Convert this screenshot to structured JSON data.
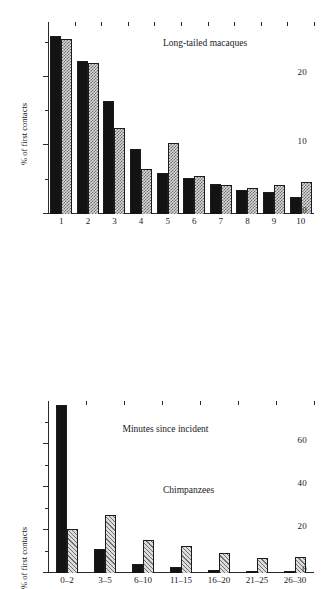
{
  "figure": {
    "background": "#ffffff",
    "series_colors": {
      "solid": "#131313",
      "patterned": "#d9d9d9"
    }
  },
  "chart_data": [
    {
      "type": "bar",
      "title": "Long-tailed macaques",
      "xlabel": "",
      "ylabel": "% of first contacts",
      "ylim": [
        0,
        28
      ],
      "yticks": [
        0,
        10,
        20
      ],
      "yticklabels": [
        "0",
        "10",
        "20"
      ],
      "yminorticks": [
        5,
        15,
        25
      ],
      "grid": false,
      "legend": "none",
      "categories": [
        "1",
        "2",
        "3",
        "4",
        "5",
        "6",
        "7",
        "8",
        "9",
        "10"
      ],
      "series": [
        {
          "name": "solid",
          "fill": "solid-black",
          "values": [
            26.0,
            22.3,
            16.5,
            9.5,
            6.0,
            5.3,
            4.4,
            3.5,
            3.2,
            2.5
          ]
        },
        {
          "name": "patterned",
          "fill": "checkerboard-grey",
          "values": [
            25.5,
            22.0,
            12.5,
            6.5,
            10.3,
            5.5,
            4.2,
            3.8,
            4.2,
            4.7
          ]
        }
      ]
    },
    {
      "type": "bar",
      "title": "Chimpanzees",
      "xlabel": "Minutes since incident",
      "ylabel": "% of first contacts",
      "ylim": [
        0,
        80
      ],
      "yticks": [
        0,
        20,
        40,
        60
      ],
      "yticklabels": [
        "0",
        "20",
        "40",
        "60"
      ],
      "yminorticks": [
        10,
        30,
        50,
        70
      ],
      "grid": false,
      "legend": "none",
      "categories": [
        "0–2",
        "3–5",
        "6–10",
        "11–15",
        "16–20",
        "21–25",
        "26–30"
      ],
      "series": [
        {
          "name": "solid",
          "fill": "solid-black",
          "values": [
            78.0,
            11.0,
            4.0,
            3.0,
            1.4,
            1.0,
            0.8
          ]
        },
        {
          "name": "patterned",
          "fill": "diagonal-hatch-grey",
          "values": [
            20.7,
            27.0,
            15.3,
            12.5,
            9.3,
            7.2,
            7.3
          ]
        }
      ]
    }
  ]
}
